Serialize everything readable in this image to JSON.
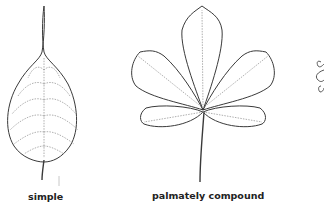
{
  "figure": {
    "panels": [
      {
        "id": "simple",
        "label": "simple"
      },
      {
        "id": "palmately-compound",
        "label": "palmately compound"
      },
      {
        "id": "partial-third",
        "label": ""
      }
    ]
  },
  "colors": {
    "outline": "#3a3a3a",
    "vein": "#9a9a9a",
    "text": "#222222",
    "background": "#ffffff"
  }
}
